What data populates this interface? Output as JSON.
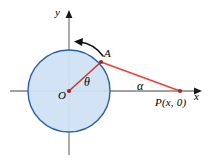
{
  "figure": {
    "background_color": "#ffffff",
    "axes": {
      "x_axis_label": "x",
      "y_axis_label": "y",
      "axis_color": "#808080",
      "origin_label": "O"
    },
    "circle": {
      "center_label": "O",
      "fill_color": "#cfe2f3",
      "stroke_color": "#2b5fa8",
      "center_x": 69,
      "center_y": 91,
      "radius": 41
    },
    "points": [
      {
        "name": "point-A",
        "label": "A",
        "x": 101,
        "y": 62,
        "color": "#c0392b"
      },
      {
        "name": "point-P",
        "label": "P(x, 0)",
        "x": 180,
        "y": 91,
        "color": "#c0392b"
      },
      {
        "name": "point-O",
        "label": "O",
        "x": 69,
        "y": 91,
        "color": "#c0392b"
      }
    ],
    "angles": [
      {
        "name": "angle-theta",
        "label": "θ",
        "vertex": "O"
      },
      {
        "name": "angle-alpha",
        "label": "α",
        "vertex": "P"
      }
    ],
    "segments": [
      {
        "name": "segment-OA",
        "from": "O",
        "to": "A",
        "color": "#c0392b"
      },
      {
        "name": "segment-AP",
        "from": "A",
        "to": "P",
        "color": "#e8413a"
      }
    ],
    "rotation_arrow": {
      "name": "counterclockwise-arrow",
      "direction": "counterclockwise",
      "color": "#111111"
    }
  }
}
